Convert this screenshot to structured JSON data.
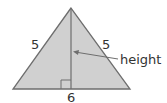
{
  "diagram": {
    "type": "isosceles-triangle",
    "side_left_label": "5",
    "side_right_label": "5",
    "base_label": "6",
    "height_label": "height",
    "colors": {
      "fill": "#cfcfcf",
      "stroke": "#6e6e6e",
      "text": "#333333"
    }
  }
}
